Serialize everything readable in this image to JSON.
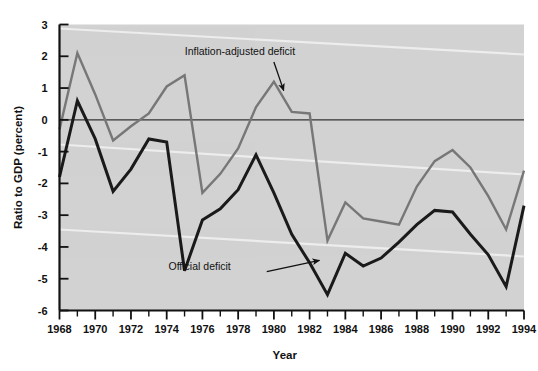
{
  "chart_data": {
    "type": "line",
    "title": "",
    "xlabel": "Year",
    "ylabel": "Ratio to GDP (percent)",
    "xlim": [
      1968,
      1994
    ],
    "ylim": [
      -6,
      3
    ],
    "ytick_values": [
      3,
      2,
      1,
      0,
      -1,
      -2,
      -3,
      -4,
      -5,
      -6
    ],
    "ytick_labels": [
      "3",
      "2",
      "1",
      "0",
      "-1",
      "-2",
      "-3",
      "-4",
      "-5",
      "-6"
    ],
    "xtick_values": [
      1968,
      1970,
      1972,
      1974,
      1976,
      1978,
      1980,
      1982,
      1984,
      1986,
      1988,
      1990,
      1992,
      1994
    ],
    "xtick_labels": [
      "1968",
      "1970",
      "1972",
      "1974",
      "1976",
      "1978",
      "1980",
      "1982",
      "1984",
      "1986",
      "1988",
      "1990",
      "1992",
      "1994"
    ],
    "xtick_minor_step": 1,
    "grid": false,
    "legend_position": "none",
    "zero_line": 0,
    "plot_bgcolor": "#d2d2d2",
    "page_bgcolor": "#ffffff",
    "x": [
      1968,
      1969,
      1970,
      1971,
      1972,
      1973,
      1974,
      1975,
      1976,
      1977,
      1978,
      1979,
      1980,
      1981,
      1982,
      1983,
      1984,
      1985,
      1986,
      1987,
      1988,
      1989,
      1990,
      1991,
      1992,
      1993,
      1994
    ],
    "series": [
      {
        "name": "Inflation-adjusted deficit",
        "color": "#777777",
        "linewidth": 2.4,
        "values": [
          -0.3,
          2.1,
          0.8,
          -0.65,
          -0.2,
          0.2,
          1.05,
          1.4,
          -2.3,
          -1.7,
          -0.9,
          0.4,
          1.2,
          0.25,
          0.2,
          -3.8,
          -2.6,
          -3.1,
          -3.2,
          -3.3,
          -2.1,
          -1.3,
          -0.95,
          -1.5,
          -2.4,
          -3.45,
          -1.6
        ]
      },
      {
        "name": "Official deficit",
        "color": "#1a1a1a",
        "linewidth": 3.0,
        "values": [
          -1.8,
          0.6,
          -0.6,
          -2.25,
          -1.55,
          -0.6,
          -0.7,
          -4.75,
          -3.15,
          -2.8,
          -2.2,
          -1.1,
          -2.3,
          -3.6,
          -4.5,
          -5.5,
          -4.2,
          -4.6,
          -4.35,
          -3.85,
          -3.3,
          -2.85,
          -2.9,
          -3.6,
          -4.25,
          -5.25,
          -2.7
        ]
      }
    ],
    "annotations": [
      {
        "text": "Inflation-adjusted deficit",
        "text_x": 1978.1,
        "text_y": 2.05,
        "arrow_from_x": 1980.0,
        "arrow_from_y": 1.82,
        "arrow_to_x": 1980.55,
        "arrow_to_y": 0.92,
        "target_series": "Inflation-adjusted deficit"
      },
      {
        "text": "Official deficit",
        "text_x": 1974.1,
        "text_y": -4.72,
        "arrow_from_x": 1979.6,
        "arrow_from_y": -4.78,
        "arrow_to_x": 1982.55,
        "arrow_to_y": -4.42,
        "target_series": "Official deficit"
      }
    ]
  }
}
